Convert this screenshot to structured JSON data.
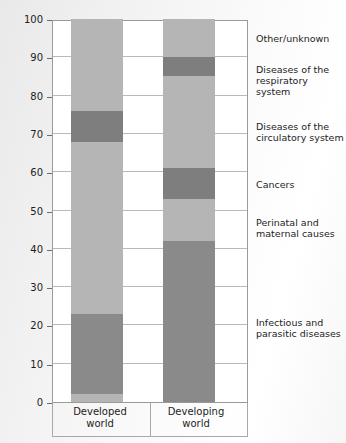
{
  "chart_data": {
    "type": "bar",
    "subtype": "stacked-100-percent",
    "title": "",
    "xlabel": "",
    "ylabel": "% of total deaths",
    "ylim": [
      0,
      100
    ],
    "ytick_step": 10,
    "yticks": [
      100,
      90,
      80,
      70,
      60,
      50,
      40,
      30,
      20,
      10,
      0
    ],
    "grid": true,
    "legend_position": "right-aligned-to-segments",
    "categories": [
      "Developed world",
      "Developing world"
    ],
    "series": [
      {
        "name": "Infectious and parasitic diseases",
        "values": [
          21,
          42
        ],
        "color": "#8a8a8a"
      },
      {
        "name": "Perinatal and maternal causes",
        "values": [
          2,
          11
        ],
        "color": "#b5b5b5"
      },
      {
        "name": "Cancers",
        "values": [
          45,
          8
        ],
        "color": "#8a8a8a"
      },
      {
        "name": "Diseases of the circulatory system",
        "values": [
          8,
          24
        ],
        "color": "#b5b5b5"
      },
      {
        "name": "Diseases of the respiratory system",
        "values": [
          0,
          5
        ],
        "color": "#8a8a8a"
      },
      {
        "name": "Other/unknown",
        "values": [
          24,
          10
        ],
        "color": "#b5b5b5"
      }
    ],
    "stacks": {
      "Developed world": [
        {
          "label": "Perinatal and maternal causes",
          "from": 0,
          "to": 2,
          "color": "#b5b5b5"
        },
        {
          "label": "Infectious and parasitic diseases",
          "from": 2,
          "to": 23,
          "color": "#8a8a8a"
        },
        {
          "label": "Cancers",
          "from": 23,
          "to": 68,
          "color": "#b5b5b5"
        },
        {
          "label": "Diseases of the circulatory system",
          "from": 68,
          "to": 76,
          "color": "#7e7e7e"
        },
        {
          "label": "Other/unknown",
          "from": 76,
          "to": 100,
          "color": "#b5b5b5"
        }
      ],
      "Developing world": [
        {
          "label": "Infectious and parasitic diseases",
          "from": 0,
          "to": 42,
          "color": "#8a8a8a"
        },
        {
          "label": "Perinatal and maternal causes",
          "from": 42,
          "to": 53,
          "color": "#b5b5b5"
        },
        {
          "label": "Cancers",
          "from": 53,
          "to": 61,
          "color": "#7e7e7e"
        },
        {
          "label": "Diseases of the circulatory system",
          "from": 61,
          "to": 85,
          "color": "#b5b5b5"
        },
        {
          "label": "Diseases of the respiratory system",
          "from": 85,
          "to": 90,
          "color": "#7e7e7e"
        },
        {
          "label": "Other/unknown",
          "from": 90,
          "to": 100,
          "color": "#b5b5b5"
        }
      ]
    },
    "legend_entries": [
      {
        "label": "Other/unknown",
        "y_percent": 95
      },
      {
        "label": "Diseases of the\nrespiratory system",
        "y_percent": 87
      },
      {
        "label": "Diseases of the\ncirculatory system",
        "y_percent": 72
      },
      {
        "label": "Cancers",
        "y_percent": 57
      },
      {
        "label": "Perinatal and\nmaternal causes",
        "y_percent": 47
      },
      {
        "label": "Infectious and\nparasitic diseases",
        "y_percent": 21
      }
    ]
  },
  "axis": {
    "y_title": "% of total deaths",
    "tick_labels": [
      "100",
      "90",
      "80",
      "70",
      "60",
      "50",
      "40",
      "30",
      "20",
      "10",
      "0"
    ]
  },
  "x_categories": [
    {
      "line1": "Developed",
      "line2": "world"
    },
    {
      "line1": "Developing",
      "line2": "world"
    }
  ],
  "legend": [
    {
      "line1": "Other/unknown",
      "line2": ""
    },
    {
      "line1": "Diseases of the",
      "line2": "respiratory system"
    },
    {
      "line1": "Diseases of the",
      "line2": "circulatory system"
    },
    {
      "line1": "Cancers",
      "line2": ""
    },
    {
      "line1": "Perinatal and",
      "line2": "maternal causes"
    },
    {
      "line1": "Infectious and",
      "line2": "parasitic diseases"
    }
  ],
  "colors": {
    "light": "#b5b5b5",
    "mid": "#8a8a8a",
    "dark": "#7e7e7e",
    "grid": "#b9b9b9",
    "frame": "#9a9a9a",
    "text": "#1d1d1d",
    "plot_bg": "#ffffff"
  }
}
